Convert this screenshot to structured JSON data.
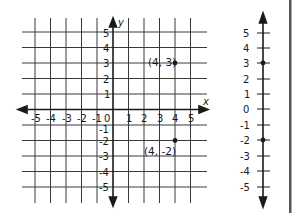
{
  "coordinate_plane": {
    "x_axis_label": "x",
    "y_axis_label": "y",
    "x_ticks": [
      "-5",
      "-4",
      "-3",
      "-2",
      "-1",
      "0",
      "1",
      "2",
      "3",
      "4",
      "5"
    ],
    "y_ticks_positive": [
      "5",
      "4",
      "3",
      "2",
      "1"
    ],
    "y_ticks_negative": [
      "-1",
      "-2",
      "-3",
      "-4",
      "-5"
    ],
    "origin_label": "0",
    "points": [
      {
        "x": 4,
        "y": 3,
        "label": "(4, 3)"
      },
      {
        "x": 4,
        "y": -2,
        "label": "(4, -2)"
      }
    ]
  },
  "number_line": {
    "orientation": "vertical",
    "ticks": [
      "5",
      "4",
      "3",
      "2",
      "1",
      "0",
      "-1",
      "-2",
      "-3",
      "-4",
      "-5"
    ],
    "points": [
      3,
      -2
    ]
  },
  "colors": {
    "ink": "#1a1a1a",
    "grid": "#3a3a3a",
    "divider": "#555555"
  }
}
